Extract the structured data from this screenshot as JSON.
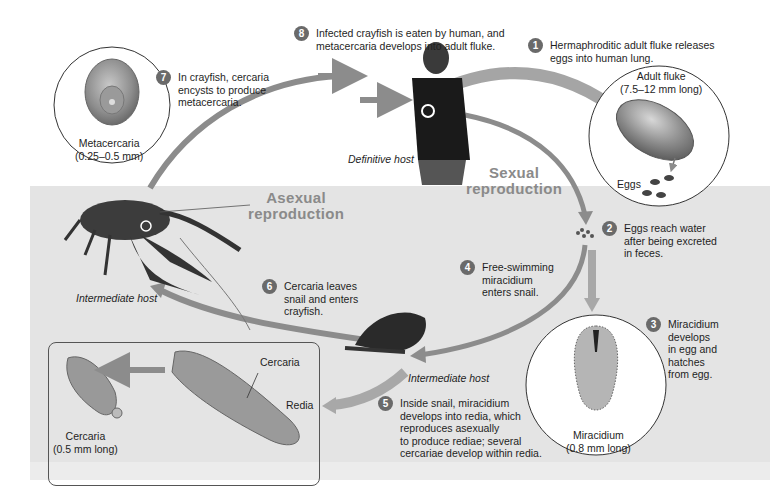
{
  "diagram": {
    "type": "life-cycle",
    "steps": [
      {
        "number": "1",
        "text": "Hermaphroditic adult fluke releases\neggs into human lung."
      },
      {
        "number": "2",
        "text": "Eggs reach water\nafter being excreted\nin feces."
      },
      {
        "number": "3",
        "text": "Miracidium\ndevelops\nin egg and\nhatches\nfrom egg."
      },
      {
        "number": "4",
        "text": "Free-swimming\nmiracidium\nenters snail."
      },
      {
        "number": "5",
        "text": "Inside snail, miracidium\ndevelops into redia, which\nreproduces asexually\nto produce rediae; several\ncercariae develop within redia."
      },
      {
        "number": "6",
        "text": "Cercaria leaves\nsnail and enters\ncrayfish."
      },
      {
        "number": "7",
        "text": "In crayfish, cercaria\nencysts to produce\nmetacercaria."
      },
      {
        "number": "8",
        "text": "Infected crayfish is eaten by human, and\nmetacercaria develops into adult fluke."
      }
    ],
    "phases": {
      "sexual": "Sexual\nreproduction",
      "asexual": "Asexual\nreproduction"
    },
    "hosts": {
      "definitive": "Definitive host",
      "intermediate_crayfish": "Intermediate host",
      "intermediate_snail": "Intermediate host"
    },
    "callouts": {
      "adult_fluke": "Adult fluke\n(7.5–12 mm long)",
      "eggs": "Eggs",
      "miracidium": "Miracidium\n(0.8 mm long)",
      "metacercaria": "Metacercaria\n(0.25–0.5 mm)",
      "cercaria_inset": "Cercaria\n(0.5 mm long)",
      "cercaria_pointer": "Cercaria",
      "redia": "Redia"
    },
    "colors": {
      "arrow": "#8c8c8c",
      "water": "#e4e4e4",
      "step_badge": "#6a6a6a",
      "phase_text": "#8a8a8a"
    }
  }
}
